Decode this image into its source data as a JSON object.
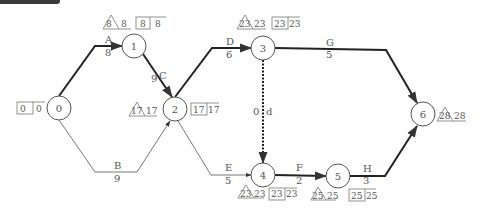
{
  "colors": {
    "critical": "#222222",
    "normal": "#666666",
    "node": "#555555",
    "text": "#555555"
  },
  "nodes": [
    {
      "id": "0",
      "label": "0",
      "x": 59,
      "y": 108,
      "box": [
        "0",
        "0"
      ],
      "box_side": "left"
    },
    {
      "id": "1",
      "label": "1",
      "x": 134,
      "y": 46,
      "tri": [
        "8",
        "8"
      ],
      "box": [
        "8",
        "8"
      ],
      "box_side": "top"
    },
    {
      "id": "2",
      "label": "2",
      "x": 175,
      "y": 109,
      "tri": [
        "17",
        "17"
      ],
      "box": [
        "17",
        "17"
      ],
      "box_side": "sides"
    },
    {
      "id": "3",
      "label": "3",
      "x": 263,
      "y": 48,
      "tri": [
        "23",
        "23"
      ],
      "box": [
        "23",
        "23"
      ],
      "box_side": "top"
    },
    {
      "id": "4",
      "label": "4",
      "x": 263,
      "y": 175,
      "tri": [
        "23",
        "23"
      ],
      "box": [
        "23",
        "23"
      ],
      "box_side": "bottom"
    },
    {
      "id": "5",
      "label": "5",
      "x": 338,
      "y": 176,
      "tri": [
        "25",
        "25"
      ],
      "box": [
        "25",
        "25"
      ],
      "box_side": "bottom"
    },
    {
      "id": "6",
      "label": "6",
      "x": 423,
      "y": 114,
      "tri": [
        "28",
        "28"
      ],
      "box_side": "right"
    }
  ],
  "activities": [
    {
      "name": "A",
      "duration": "8",
      "from": "0",
      "to": "1",
      "critical": true
    },
    {
      "name": "B",
      "duration": "9",
      "from": "0",
      "to": "2",
      "critical": false
    },
    {
      "name": "C",
      "duration": "9",
      "from": "1",
      "to": "2",
      "critical": true
    },
    {
      "name": "D",
      "duration": "6",
      "from": "2",
      "to": "3",
      "critical": true
    },
    {
      "name": "E",
      "duration": "5",
      "from": "2",
      "to": "4",
      "critical": false
    },
    {
      "name": "d",
      "duration": "0",
      "from": "3",
      "to": "4",
      "critical": true,
      "dummy": true
    },
    {
      "name": "F",
      "duration": "2",
      "from": "4",
      "to": "5",
      "critical": true
    },
    {
      "name": "G",
      "duration": "5",
      "from": "3",
      "to": "6",
      "critical": true
    },
    {
      "name": "H",
      "duration": "3",
      "from": "5",
      "to": "6",
      "critical": true
    }
  ]
}
